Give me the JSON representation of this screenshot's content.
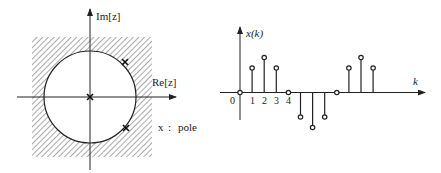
{
  "left_diagram": {
    "title": "z-plane pole plot",
    "imag_axis_label": "Im[z]",
    "real_axis_label": "Re[z]",
    "legend": {
      "symbol": "x",
      "separator": ":",
      "text": "pole"
    },
    "unit_circle": true,
    "hatched_region": "outside unit circle",
    "poles": [
      {
        "re": 0,
        "im": 0
      },
      {
        "re": 0.76,
        "im": 0.76,
        "on_circle": true
      },
      {
        "re": 0.78,
        "im": -0.7,
        "on_circle": true
      }
    ]
  },
  "right_plot": {
    "ylabel": "x(k)",
    "xlabel": "k",
    "tick_labels": [
      "0",
      "1",
      "2",
      "3",
      "4"
    ]
  },
  "chart_data": {
    "type": "stem",
    "title": "",
    "xlabel": "k",
    "ylabel": "x(k)",
    "x": [
      0,
      1,
      2,
      3,
      4,
      5,
      6,
      7,
      8,
      9,
      10,
      11
    ],
    "values": [
      0,
      0.7,
      1.0,
      0.7,
      0,
      -0.7,
      -1.0,
      -0.7,
      0,
      0.7,
      1.0,
      0.7
    ],
    "x_tick_labels": [
      "0",
      "1",
      "2",
      "3",
      "4"
    ],
    "grid": false
  }
}
